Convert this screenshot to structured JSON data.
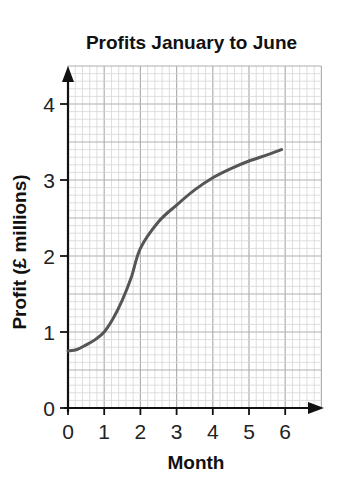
{
  "chart_data": {
    "type": "line",
    "title": "Profits January to June",
    "xlabel": "Month",
    "ylabel": "Profit (£ millions)",
    "x_ticks": [
      "0",
      "1",
      "2",
      "3",
      "4",
      "5",
      "6"
    ],
    "y_ticks": [
      "0",
      "1",
      "2",
      "3",
      "4"
    ],
    "xlim": [
      0,
      7
    ],
    "ylim": [
      0,
      4.5
    ],
    "grid": true,
    "legend": null,
    "series": [
      {
        "name": "Profit",
        "color": "#555555",
        "x": [
          0,
          0.25,
          0.5,
          0.75,
          1,
          1.25,
          1.5,
          1.75,
          2,
          2.5,
          3,
          3.5,
          4,
          4.5,
          5,
          5.5,
          5.9
        ],
        "y": [
          0.75,
          0.77,
          0.83,
          0.9,
          1.0,
          1.18,
          1.42,
          1.72,
          2.1,
          2.45,
          2.67,
          2.87,
          3.03,
          3.15,
          3.25,
          3.33,
          3.4
        ]
      }
    ]
  }
}
